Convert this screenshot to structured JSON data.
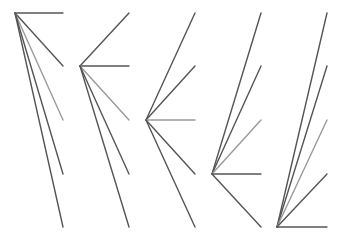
{
  "diagram": {
    "title": "",
    "width": 342,
    "height": 239,
    "colors": {
      "background": "#ffffff",
      "line_dark": "#555555",
      "line_light": "#9a9a9a"
    },
    "stroke_width": 1.4,
    "endpoint_rows_y": [
      13,
      66,
      120,
      174,
      227
    ],
    "light_row_index": 2,
    "groups": [
      {
        "id": "fan-1",
        "vertex": [
          15,
          13
        ],
        "end_x": 63
      },
      {
        "id": "fan-2",
        "vertex": [
          80,
          66
        ],
        "end_x": 129
      },
      {
        "id": "fan-3",
        "vertex": [
          146,
          120
        ],
        "end_x": 195
      },
      {
        "id": "fan-4",
        "vertex": [
          212,
          174
        ],
        "end_x": 261
      },
      {
        "id": "fan-5",
        "vertex": [
          277,
          227
        ],
        "end_x": 327
      }
    ]
  }
}
